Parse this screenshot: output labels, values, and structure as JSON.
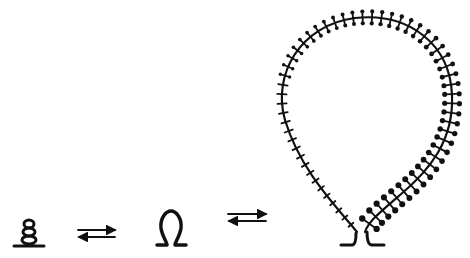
{
  "diagram": {
    "stages": [
      {
        "id": "stage-1",
        "name": "coiled compact form"
      },
      {
        "id": "stage-2",
        "name": "omega loop"
      },
      {
        "id": "stage-3",
        "name": "extended bristled loop"
      }
    ],
    "arrows": [
      {
        "id": "equilibrium-1",
        "type": "reversible",
        "between": [
          "stage-1",
          "stage-2"
        ]
      },
      {
        "id": "equilibrium-2",
        "type": "reversible",
        "between": [
          "stage-2",
          "stage-3"
        ]
      }
    ],
    "colors": {
      "ink": "#111111",
      "background": "#ffffff"
    }
  }
}
